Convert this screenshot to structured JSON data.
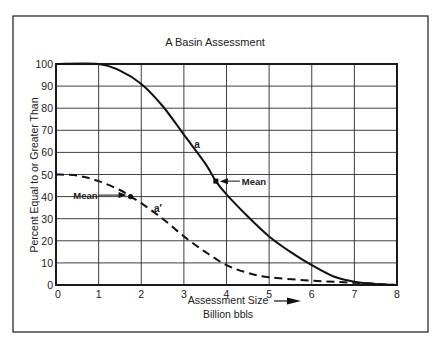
{
  "chart_data": {
    "type": "line",
    "title": "A Basin Assessment",
    "xlabel": "Assessment Size",
    "xlabel_line2": "Billion bbls",
    "ylabel": "Percent Equal to or Greater Than",
    "xlim": [
      0,
      8
    ],
    "ylim": [
      0,
      100
    ],
    "x_ticks": [
      0,
      1,
      2,
      3,
      4,
      5,
      6,
      7,
      8
    ],
    "y_ticks": [
      0,
      10,
      20,
      30,
      40,
      50,
      60,
      70,
      80,
      90,
      100
    ],
    "grid": true,
    "legend": null,
    "series": [
      {
        "name": "a",
        "style": "solid",
        "x": [
          0,
          1,
          1.5,
          2,
          2.5,
          3,
          3.5,
          3.75,
          4,
          4.5,
          5,
          5.5,
          6,
          6.5,
          7,
          7.5,
          8
        ],
        "y": [
          100,
          100,
          97,
          91,
          81,
          68,
          55,
          47,
          41,
          31,
          22,
          15,
          9,
          4,
          1.5,
          0.5,
          0
        ],
        "mean": {
          "x": 3.75,
          "y": 47
        },
        "label_pos": {
          "x": 3.15,
          "y": 64
        }
      },
      {
        "name": "a′",
        "style": "dashed",
        "x": [
          0,
          0.5,
          1,
          1.5,
          1.75,
          2,
          2.5,
          3,
          3.5,
          4,
          4.5,
          5,
          6,
          7,
          8
        ],
        "y": [
          50,
          49.5,
          47,
          43,
          40,
          37,
          30,
          22,
          15,
          9,
          5.5,
          3.5,
          2,
          1,
          0
        ],
        "mean": {
          "x": 1.75,
          "y": 40
        },
        "label_pos": {
          "x": 2.3,
          "y": 35
        }
      }
    ],
    "annotations": [
      {
        "text": "Mean",
        "target_series": "a",
        "x": 3.75,
        "y": 47,
        "side": "right"
      },
      {
        "text": "Mean",
        "target_series": "a′",
        "x": 1.75,
        "y": 40,
        "side": "left"
      }
    ]
  },
  "labels": {
    "title": "A Basin Assessment",
    "xlabel": "Assessment Size",
    "xlabel_line2": "Billion bbls",
    "ylabel": "Percent Equal to or Greater Than",
    "mean_label": "Mean",
    "series_a": "a",
    "series_a_prime": "a′"
  },
  "colors": {
    "ink": "#1a1a1a",
    "grid": "#2a2a2a",
    "background": "#ffffff"
  }
}
